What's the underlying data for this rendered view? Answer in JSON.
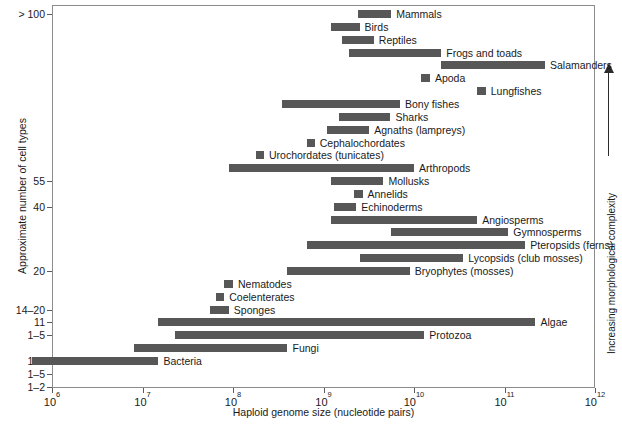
{
  "chart_data": {
    "type": "bar",
    "orientation": "horizontal",
    "title": "",
    "xlabel": "Haploid genome size (nucleotide pairs)",
    "ylabel": "Approximate number of cell types",
    "xscale": "log",
    "xlim": [
      1000000,
      1000000000000
    ],
    "grid": false,
    "legend": null,
    "xticks": [
      {
        "value": 1000000,
        "label": "10",
        "exp": "6"
      },
      {
        "value": 10000000,
        "label": "10",
        "exp": "7"
      },
      {
        "value": 100000000,
        "label": "10",
        "exp": "8"
      },
      {
        "value": 1000000000,
        "label": "10",
        "exp": "9"
      },
      {
        "value": 10000000000,
        "label": "10",
        "exp": "10"
      },
      {
        "value": 100000000000,
        "label": "10",
        "exp": "11"
      },
      {
        "value": 1000000000000,
        "label": "10",
        "exp": "12"
      }
    ],
    "yticks": [
      {
        "label": "> 100",
        "row": 0
      },
      {
        "label": "55",
        "row": 13
      },
      {
        "label": "40",
        "row": 15
      },
      {
        "label": "20",
        "row": 20
      },
      {
        "label": "14–20",
        "row": 23
      },
      {
        "label": "11",
        "row": 24
      },
      {
        "label": "1–5",
        "row": 25
      },
      {
        "label": "1–5",
        "row": 27
      },
      {
        "label": "1–5",
        "row": 28
      },
      {
        "label": "1–2",
        "row": 29
      }
    ],
    "annotation": "Increasing morphological complexity",
    "bars": [
      {
        "name": "Mammals",
        "xmin": 2400000000.0,
        "xmax": 5600000000.0
      },
      {
        "name": "Birds",
        "xmin": 1200000000.0,
        "xmax": 2500000000.0
      },
      {
        "name": "Reptiles",
        "xmin": 1600000000.0,
        "xmax": 3600000000.0
      },
      {
        "name": "Frogs and toads",
        "xmin": 1900000000.0,
        "xmax": 20000000000.0
      },
      {
        "name": "Salamanders",
        "xmin": 20000000000.0,
        "xmax": 280000000000.0
      },
      {
        "name": "Apoda",
        "xmin": 12000000000.0,
        "xmax": 15000000000.0
      },
      {
        "name": "Lungfishes",
        "xmin": 50000000000.0,
        "xmax": 62000000000.0
      },
      {
        "name": "Bony fishes",
        "xmin": 350000000.0,
        "xmax": 7000000000.0
      },
      {
        "name": "Sharks",
        "xmin": 1500000000.0,
        "xmax": 5500000000.0
      },
      {
        "name": "Agnaths (lampreys)",
        "xmin": 1100000000.0,
        "xmax": 3200000000.0
      },
      {
        "name": "Cephalochordates",
        "xmin": 650000000.0,
        "xmax": 800000000.0
      },
      {
        "name": "Urochordates (tunicates)",
        "xmin": 180000000.0,
        "xmax": 220000000.0
      },
      {
        "name": "Arthropods",
        "xmin": 90000000.0,
        "xmax": 10000000000.0
      },
      {
        "name": "Mollusks",
        "xmin": 1200000000.0,
        "xmax": 4600000000.0
      },
      {
        "name": "Annelids",
        "xmin": 2200000000.0,
        "xmax": 2700000000.0
      },
      {
        "name": "Echinoderms",
        "xmin": 1300000000.0,
        "xmax": 2300000000.0
      },
      {
        "name": "Angiosperms",
        "xmin": 1200000000.0,
        "xmax": 50000000000.0
      },
      {
        "name": "Gymnosperms",
        "xmin": 5500000000.0,
        "xmax": 110000000000.0
      },
      {
        "name": "Pteropsids (ferns)",
        "xmin": 650000000.0,
        "xmax": 170000000000.0
      },
      {
        "name": "Lycopsids (club mosses)",
        "xmin": 2500000000.0,
        "xmax": 35000000000.0
      },
      {
        "name": "Bryophytes (mosses)",
        "xmin": 400000000.0,
        "xmax": 9000000000.0
      },
      {
        "name": "Nematodes",
        "xmin": 80000000.0,
        "xmax": 100000000.0
      },
      {
        "name": "Coelenterates",
        "xmin": 65000000.0,
        "xmax": 80000000.0
      },
      {
        "name": "Sponges",
        "xmin": 55000000.0,
        "xmax": 90000000.0
      },
      {
        "name": "Algae",
        "xmin": 15000000.0,
        "xmax": 220000000000.0
      },
      {
        "name": "Protozoa",
        "xmin": 23000000.0,
        "xmax": 13000000000.0
      },
      {
        "name": "Fungi",
        "xmin": 8000000.0,
        "xmax": 400000000.0
      },
      {
        "name": "Bacteria",
        "xmin": 600000.0,
        "xmax": 15000000.0
      }
    ],
    "colors": {
      "bar": "#575757",
      "axis": "#8c8c8c",
      "text": "#1a1a1a",
      "background": "#ffffff"
    }
  }
}
